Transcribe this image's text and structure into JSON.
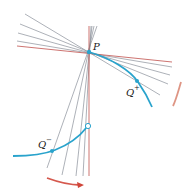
{
  "diagram": {
    "colors": {
      "curve": "#29a3cc",
      "tangent": "#c0504d",
      "secant": "#8a8f99",
      "arrow": "#d0463a",
      "background": "#ffffff"
    },
    "labels": {
      "P": "P",
      "Q_plus": "Q",
      "Q_plus_sup": "+",
      "Q_minus": "Q",
      "Q_minus_sup": "−"
    },
    "points": {
      "P": [
        89,
        52
      ],
      "Q_plus": [
        137,
        81
      ],
      "Q_minus": [
        52,
        151
      ],
      "open_circle": [
        88,
        126
      ]
    },
    "upper_secants": [
      [
        [
          25,
          14
        ],
        [
          160,
          95
        ]
      ],
      [
        [
          20,
          24
        ],
        [
          168,
          84
        ]
      ],
      [
        [
          18,
          33
        ],
        [
          170,
          75
        ]
      ],
      [
        [
          17,
          41
        ],
        [
          172,
          67
        ]
      ]
    ],
    "lower_secants": [
      [
        [
          96,
          26
        ],
        [
          48,
          166
        ]
      ],
      [
        [
          93,
          26
        ],
        [
          62,
          174
        ]
      ],
      [
        [
          92,
          26
        ],
        [
          76,
          176
        ]
      ],
      [
        [
          91,
          26
        ],
        [
          83,
          176
        ]
      ]
    ],
    "tangent_horizontal": [
      [
        17,
        46
      ],
      [
        172,
        62
      ]
    ],
    "tangent_vertical": [
      [
        89,
        26
      ],
      [
        89,
        176
      ]
    ]
  }
}
